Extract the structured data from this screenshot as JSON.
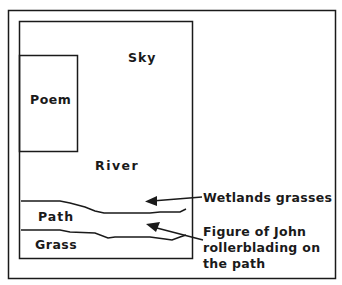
{
  "diagram": {
    "regions": {
      "sky": "Sky",
      "poem": "Poem",
      "river": "River",
      "path": "Path",
      "grass": "Grass"
    },
    "annotations": {
      "wetlands": "Wetlands grasses",
      "figure_line1": "Figure of John",
      "figure_line2": "rollerblading on",
      "figure_line3": "the path"
    },
    "colors": {
      "ink": "#1a1a1a",
      "background": "#ffffff"
    }
  }
}
